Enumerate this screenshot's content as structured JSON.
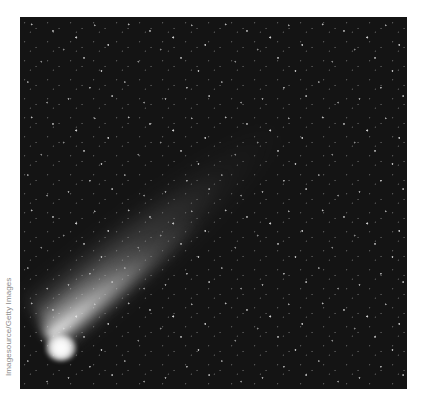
{
  "image": {
    "subject": "comet with long tail against starry night sky",
    "alt": "Bright comet with a diffuse white tail streaking diagonally toward the upper right across a dark star field",
    "colors": {
      "sky": "#141414",
      "comet_head": "#ffffff",
      "page_background": "#ffffff",
      "credit_text": "#8a8a8a"
    }
  },
  "credit": {
    "text": "Imagesource/Getty Images"
  }
}
